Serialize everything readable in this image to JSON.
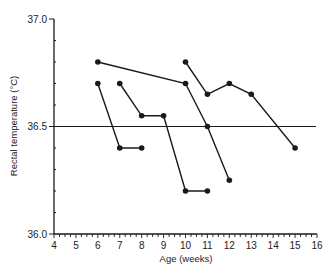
{
  "chart_data": {
    "type": "line",
    "title": "",
    "xlabel": "Age (weeks)",
    "ylabel": "Rectal temperature (°C)",
    "xlim": [
      4,
      16
    ],
    "ylim": [
      36.0,
      37.0
    ],
    "x_ticks": [
      "4",
      "5",
      "6",
      "7",
      "8",
      "9",
      "10",
      "11",
      "12",
      "13",
      "14",
      "15",
      "16"
    ],
    "y_ticks": [
      "36.0",
      "36.5",
      "37.0"
    ],
    "grid": false,
    "legend": null,
    "reference_line": {
      "y": 36.5,
      "orientation": "horizontal"
    },
    "series": [
      {
        "name": "Subject A",
        "points": [
          [
            6,
            36.8
          ],
          [
            10,
            36.7
          ],
          [
            11,
            36.5
          ],
          [
            12,
            36.25
          ]
        ]
      },
      {
        "name": "Subject B",
        "points": [
          [
            6,
            36.7
          ],
          [
            7,
            36.4
          ],
          [
            8,
            36.4
          ]
        ]
      },
      {
        "name": "Subject C",
        "points": [
          [
            7,
            36.7
          ],
          [
            8,
            36.55
          ],
          [
            9,
            36.55
          ],
          [
            10,
            36.2
          ],
          [
            11,
            36.2
          ]
        ]
      },
      {
        "name": "Subject D",
        "points": [
          [
            10,
            36.8
          ],
          [
            11,
            36.65
          ],
          [
            12,
            36.7
          ],
          [
            13,
            36.65
          ],
          [
            15,
            36.4
          ]
        ]
      }
    ],
    "colors": {
      "line": "#1a1a1a",
      "marker": "#1a1a1a",
      "axis": "#1a1a1a"
    }
  }
}
